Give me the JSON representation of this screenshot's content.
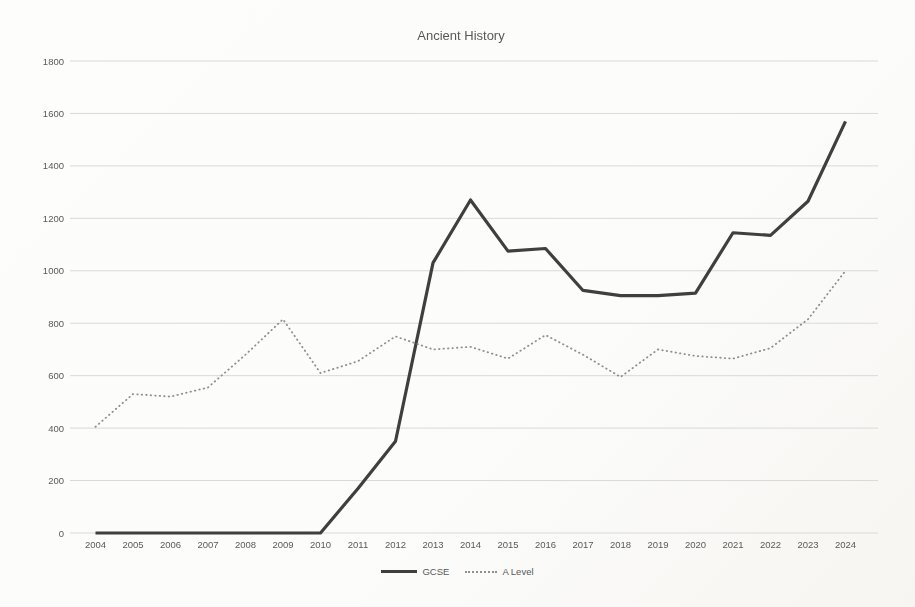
{
  "chart_data": {
    "type": "line",
    "title": "Ancient History",
    "categories": [
      "2004",
      "2005",
      "2006",
      "2007",
      "2008",
      "2009",
      "2010",
      "2011",
      "2012",
      "2013",
      "2014",
      "2015",
      "2016",
      "2017",
      "2018",
      "2019",
      "2020",
      "2021",
      "2022",
      "2023",
      "2024"
    ],
    "series": [
      {
        "name": "GCSE",
        "style": "solid",
        "color": "#3f3f3f",
        "values": [
          0,
          0,
          0,
          0,
          0,
          0,
          0,
          170,
          350,
          1030,
          1270,
          1075,
          1085,
          925,
          905,
          905,
          915,
          1145,
          1135,
          1265,
          1570
        ]
      },
      {
        "name": "A Level",
        "style": "dotted",
        "color": "#8f8f8f",
        "values": [
          405,
          530,
          520,
          555,
          680,
          815,
          610,
          655,
          750,
          700,
          710,
          665,
          755,
          680,
          595,
          700,
          675,
          665,
          705,
          815,
          1000
        ]
      }
    ],
    "xlabel": "",
    "ylabel": "",
    "ylim": [
      0,
      1800
    ],
    "ytick_interval": 200,
    "yticks": [
      "0",
      "200",
      "400",
      "600",
      "800",
      "1000",
      "1200",
      "1400",
      "1600",
      "1800"
    ],
    "grid": "horizontal",
    "legend_position": "bottom",
    "colors": {
      "grid": "#d9d9d9",
      "text": "#595959",
      "background": "#fcfcfa"
    }
  }
}
